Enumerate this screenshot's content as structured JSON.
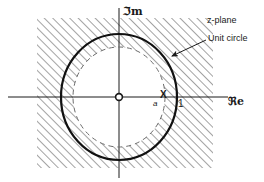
{
  "figure": {
    "name": "z-plane-region-of-convergence",
    "background": "#ffffff",
    "ink": "#1a1a1a",
    "hatch_color": "#4d4d4d",
    "width": 264,
    "height": 182
  },
  "labels": {
    "plane": "z-plane",
    "unit_circle": "Unit circle",
    "imaginary_axis": "ℑm",
    "real_axis": "ℜe",
    "pole_marker": "X",
    "pole_value": "a",
    "unit_value": "1"
  },
  "geometry": {
    "origin": {
      "x": 119,
      "y": 97
    },
    "unit_circle": {
      "rx": 58,
      "ry": 63,
      "stroke_width": 2.2,
      "style": "solid",
      "label_ref": "unit_circle"
    },
    "inner_circle": {
      "rx": 46,
      "ry": 50,
      "stroke_width": 1,
      "style": "dashed",
      "label_ref": "pole_value"
    },
    "hatch_rect": {
      "x": 37,
      "y": 18,
      "width": 176,
      "height": 150
    },
    "axes": {
      "real": {
        "x1": 8,
        "y1": 97,
        "x2": 228,
        "y2": 97
      },
      "imag": {
        "x1": 119,
        "y1": 8,
        "x2": 119,
        "y2": 178
      }
    },
    "origin_marker": {
      "cx": 119,
      "cy": 97,
      "r": 3.4
    },
    "pole_point": {
      "x": 165,
      "y": 97
    },
    "unit_tick": {
      "x": 177,
      "y": 97
    },
    "callout_arrow": {
      "from_x": 206,
      "from_y": 40,
      "to_x": 172,
      "to_y": 56
    }
  },
  "label_positions": {
    "plane": {
      "left": 207,
      "top": 16
    },
    "unit_circle": {
      "left": 208,
      "top": 34
    },
    "imaginary_axis": {
      "left": 123,
      "top": 6
    },
    "real_axis": {
      "left": 228,
      "top": 96
    },
    "pole_marker": {
      "left": 160,
      "top": 90
    },
    "pole_value": {
      "left": 153,
      "top": 100
    },
    "unit_value": {
      "left": 178,
      "top": 99
    }
  }
}
